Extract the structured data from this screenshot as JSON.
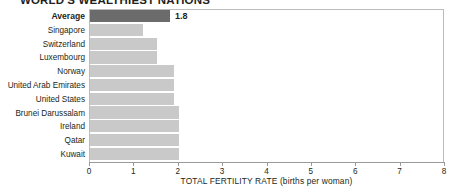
{
  "chart_data": {
    "type": "bar",
    "orientation": "horizontal",
    "title": "WORLD'S WEALTHIEST NATIONS",
    "xlabel": "TOTAL FERTILITY RATE",
    "xlabel_unit": "(births per woman)",
    "ylabel": "",
    "xlim": [
      0,
      8
    ],
    "xticks": [
      0,
      1,
      2,
      3,
      4,
      5,
      6,
      7,
      8
    ],
    "xtick_labels": [
      "0",
      "1",
      "2",
      "3",
      "4",
      "5",
      "6",
      "7",
      "8"
    ],
    "grid": false,
    "legend": "none",
    "categories": [
      "Average",
      "Singapore",
      "Switzerland",
      "Luxembourg",
      "Norway",
      "United Arab Emirates",
      "United States",
      "Brunei Darussalam",
      "Ireland",
      "Qatar",
      "Kuwait"
    ],
    "values": [
      1.8,
      1.2,
      1.5,
      1.5,
      1.9,
      1.9,
      1.9,
      2.0,
      2.0,
      2.0,
      2.0
    ],
    "data_labels": [
      "1.8",
      "",
      "",
      "",
      "",
      "",
      "",
      "",
      "",
      "",
      ""
    ],
    "highlight_category": "Average",
    "colors": {
      "bar": "#c9c9c9",
      "bar_highlight": "#6b6b6b",
      "axis": "#9a9a9a",
      "frame": "#bcbcbc",
      "text": "#231f20",
      "background": "#ffffff"
    }
  }
}
